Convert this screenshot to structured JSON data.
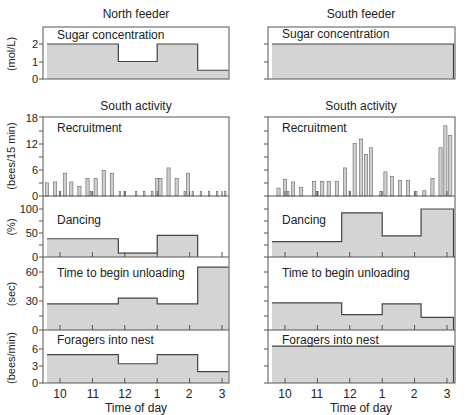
{
  "chart_data": [
    {
      "type": "area",
      "title": "North feeder",
      "panel": "Sugar concentration",
      "ylabel": "(mol/L)",
      "yticks": [
        0,
        1,
        2
      ],
      "ylim": [
        0,
        2.5
      ],
      "steps": [
        {
          "x0": 9.6,
          "x1": 11.8,
          "y": 2.0
        },
        {
          "x0": 11.8,
          "x1": 13.0,
          "y": 1.0
        },
        {
          "x0": 13.0,
          "x1": 14.25,
          "y": 2.0
        },
        {
          "x0": 14.25,
          "x1": 15.2,
          "y": 0.5
        }
      ]
    },
    {
      "type": "area",
      "title": "South feeder",
      "panel": "Sugar concentration",
      "ylim": [
        0,
        2.5
      ],
      "steps": [
        {
          "x0": 9.6,
          "x1": 15.2,
          "y": 2.0
        }
      ]
    },
    {
      "type": "bar",
      "title": "South activity",
      "column": "North feeder",
      "panel": "Recruitment",
      "ylabel": "(bees/15 min)",
      "yticks": [
        0,
        6,
        12,
        18
      ],
      "ylim": [
        0,
        18
      ],
      "x": [
        9.6,
        9.85,
        10.0,
        10.15,
        10.35,
        10.6,
        10.85,
        10.95,
        11.1,
        11.35,
        11.6,
        11.85,
        12.0,
        12.35,
        12.6,
        12.85,
        13.0,
        13.1,
        13.35,
        13.6,
        13.85,
        13.95,
        14.1,
        14.35,
        14.6,
        14.85,
        15.1
      ],
      "values": [
        3,
        3.2,
        1,
        5.2,
        3.2,
        2.2,
        4,
        1,
        4,
        5.8,
        5.2,
        1,
        1,
        1,
        1,
        1,
        4,
        4,
        6.4,
        4,
        1,
        5.2,
        1,
        1,
        1,
        1,
        1
      ]
    },
    {
      "type": "bar",
      "title": "South activity",
      "column": "South feeder",
      "panel": "Recruitment",
      "ylim": [
        0,
        18
      ],
      "x": [
        9.8,
        10.0,
        10.1,
        10.25,
        10.5,
        10.9,
        11.0,
        11.15,
        11.35,
        11.6,
        11.85,
        12.0,
        12.15,
        12.35,
        12.5,
        12.65,
        12.95,
        13.1,
        13.3,
        13.55,
        13.8,
        14.05,
        14.3,
        14.55,
        14.8,
        14.95,
        15.1
      ],
      "values": [
        1.8,
        3.8,
        1,
        3.2,
        2,
        3.3,
        1,
        3.3,
        3.3,
        3.3,
        6.4,
        1,
        12,
        13,
        9.5,
        11,
        1,
        5.5,
        4.5,
        3.5,
        3.5,
        1,
        1.2,
        4,
        11,
        16,
        13.8
      ]
    },
    {
      "type": "area",
      "column": "North feeder",
      "panel": "Dancing",
      "ylabel": "(%)",
      "yticks": [
        0,
        50,
        100
      ],
      "ylim": [
        0,
        110
      ],
      "steps": [
        {
          "x0": 9.6,
          "x1": 11.8,
          "y": 38
        },
        {
          "x0": 11.8,
          "x1": 13.0,
          "y": 8
        },
        {
          "x0": 13.0,
          "x1": 14.25,
          "y": 45
        }
      ]
    },
    {
      "type": "area",
      "column": "South feeder",
      "panel": "Dancing",
      "ylim": [
        0,
        110
      ],
      "steps": [
        {
          "x0": 9.6,
          "x1": 11.75,
          "y": 32
        },
        {
          "x0": 11.75,
          "x1": 13.0,
          "y": 92
        },
        {
          "x0": 13.0,
          "x1": 14.2,
          "y": 44
        },
        {
          "x0": 14.2,
          "x1": 15.2,
          "y": 100
        }
      ]
    },
    {
      "type": "area",
      "column": "North feeder",
      "panel": "Time to begin unloading",
      "ylabel": "(sec)",
      "yticks": [
        0,
        30,
        60
      ],
      "ylim": [
        0,
        75
      ],
      "steps": [
        {
          "x0": 9.6,
          "x1": 11.8,
          "y": 27
        },
        {
          "x0": 11.8,
          "x1": 13.0,
          "y": 33
        },
        {
          "x0": 13.0,
          "x1": 14.25,
          "y": 27
        },
        {
          "x0": 14.25,
          "x1": 15.2,
          "y": 65
        }
      ]
    },
    {
      "type": "area",
      "column": "South feeder",
      "panel": "Time to begin unloading",
      "ylim": [
        0,
        75
      ],
      "steps": [
        {
          "x0": 9.6,
          "x1": 11.75,
          "y": 28
        },
        {
          "x0": 11.75,
          "x1": 13.0,
          "y": 16
        },
        {
          "x0": 13.0,
          "x1": 14.2,
          "y": 27
        },
        {
          "x0": 14.2,
          "x1": 15.2,
          "y": 13
        }
      ]
    },
    {
      "type": "area",
      "column": "North feeder",
      "panel": "Foragers into nest",
      "ylabel": "(bees/min)",
      "yticks": [
        0,
        3,
        6
      ],
      "ylim": [
        0,
        8
      ],
      "xlabel": "Time of day",
      "xticks": [
        "10",
        "11",
        "12",
        "1",
        "2",
        "3"
      ],
      "steps": [
        {
          "x0": 9.6,
          "x1": 11.8,
          "y": 5
        },
        {
          "x0": 11.8,
          "x1": 13.0,
          "y": 3.4
        },
        {
          "x0": 13.0,
          "x1": 14.25,
          "y": 5
        },
        {
          "x0": 14.25,
          "x1": 15.2,
          "y": 2
        }
      ]
    },
    {
      "type": "area",
      "column": "South feeder",
      "panel": "Foragers into nest",
      "ylim": [
        0,
        8
      ],
      "xlabel": "Time of day",
      "xticks": [
        "10",
        "11",
        "12",
        "1",
        "2",
        "3"
      ],
      "steps": [
        {
          "x0": 9.6,
          "x1": 15.2,
          "y": 6.5
        }
      ]
    }
  ],
  "labels": {
    "north_title": "North feeder",
    "south_title": "South feeder",
    "activity_title": "South activity",
    "sugar": "Sugar concentration",
    "recruitment": "Recruitment",
    "dancing": "Dancing",
    "unloading": "Time to begin unloading",
    "foragers": "Foragers into nest",
    "xlabel": "Time of day",
    "y_sugar": "(mol/L)",
    "y_recruit": "(bees/15 min)",
    "y_dance": "(%)",
    "y_unload": "(sec)",
    "y_forager": "(bees/min)"
  },
  "ticks": {
    "sugar": [
      "0",
      "1",
      "2"
    ],
    "recruit": [
      "0",
      "6",
      "12",
      "18"
    ],
    "dance": [
      "0",
      "50",
      "100"
    ],
    "unload": [
      "0",
      "30",
      "60"
    ],
    "forager": [
      "0",
      "3",
      "6"
    ],
    "time": [
      "10",
      "11",
      "12",
      "1",
      "2",
      "3"
    ]
  },
  "colors": {
    "fill": "#d4d4d4",
    "line": "#444444",
    "frame": "#555555"
  }
}
